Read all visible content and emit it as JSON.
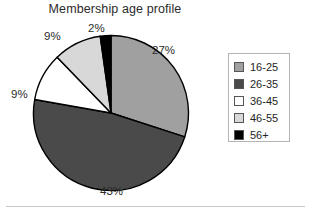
{
  "chart_data": {
    "type": "pie",
    "title": "Membership age profile",
    "categories": [
      "16-25",
      "26-35",
      "36-45",
      "46-55",
      "56+"
    ],
    "values": [
      27,
      43,
      9,
      9,
      2
    ],
    "value_labels": [
      "27%",
      "43%",
      "9%",
      "9%",
      "2%"
    ],
    "unit": "%",
    "colors": [
      "#a0a0a0",
      "#4a4a4a",
      "#ffffff",
      "#d8d8d8",
      "#000000"
    ],
    "slice_edge_color": "#000000",
    "start_angle_deg": 0,
    "direction": "clockwise",
    "legend_position": "right",
    "legend_border_color": "#b4b4b4",
    "grid": false,
    "xlabel": "",
    "ylabel": ""
  },
  "legend": {
    "entries": [
      {
        "label": "16-25",
        "color": "#a0a0a0"
      },
      {
        "label": "26-35",
        "color": "#4a4a4a"
      },
      {
        "label": "36-45",
        "color": "#ffffff"
      },
      {
        "label": "46-55",
        "color": "#d8d8d8"
      },
      {
        "label": "56+",
        "color": "#000000"
      }
    ]
  }
}
